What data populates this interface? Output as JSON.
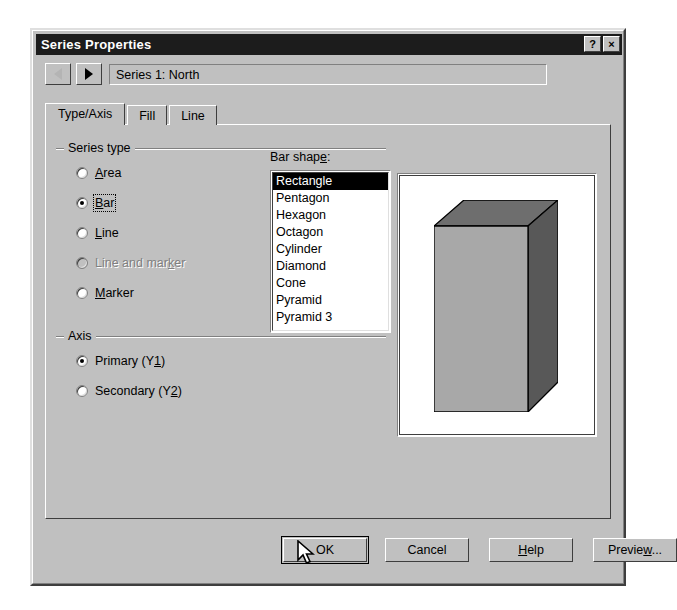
{
  "window": {
    "title": "Series Properties",
    "titlebar_buttons": [
      {
        "name": "help-button",
        "label": "?"
      },
      {
        "name": "close-button",
        "label": "×"
      }
    ]
  },
  "navigator": {
    "prev_icon": "triangle-left-icon",
    "next_icon": "triangle-right-icon",
    "series_value": "Series 1:  North"
  },
  "tabs": [
    {
      "label": "Type/Axis",
      "active": true
    },
    {
      "label": "Fill",
      "active": false
    },
    {
      "label": "Line",
      "active": false
    }
  ],
  "series_type": {
    "group_label": "Series type",
    "options": [
      {
        "label": "Area",
        "accel": "A",
        "checked": false,
        "disabled": false,
        "focused": false
      },
      {
        "label": "Bar",
        "accel": "B",
        "checked": true,
        "disabled": false,
        "focused": true
      },
      {
        "label": "Line",
        "accel": "L",
        "checked": false,
        "disabled": false,
        "focused": false
      },
      {
        "label": "Line and marker",
        "accel": "k",
        "checked": false,
        "disabled": true,
        "focused": false
      },
      {
        "label": "Marker",
        "accel": "M",
        "checked": false,
        "disabled": false,
        "focused": false
      }
    ]
  },
  "bar_shape": {
    "label": "Bar shape:",
    "items": [
      "Rectangle",
      "Pentagon",
      "Hexagon",
      "Octagon",
      "Cylinder",
      "Diamond",
      "Cone",
      "Pyramid",
      "Pyramid 3"
    ],
    "selected": "Rectangle"
  },
  "axis": {
    "group_label": "Axis",
    "options": [
      {
        "label": "Primary (Y1)",
        "checked": true,
        "disabled": false
      },
      {
        "label": "Secondary (Y2)",
        "checked": false,
        "disabled": false
      }
    ]
  },
  "preview": {
    "name": "bar-shape-preview",
    "shape": "rectangle-3d-bar",
    "background": "#ffffff",
    "front_color": "#a8a8a8",
    "top_color": "#6e6e6e",
    "side_color": "#585858",
    "outline_color": "#000000"
  },
  "buttons": {
    "ok": "OK",
    "cancel": "Cancel",
    "help": "Help",
    "help_accel": "H",
    "preview": "Preview...",
    "preview_accel": "w"
  },
  "cursor": {
    "name": "mouse-pointer",
    "over": "ok-button"
  }
}
